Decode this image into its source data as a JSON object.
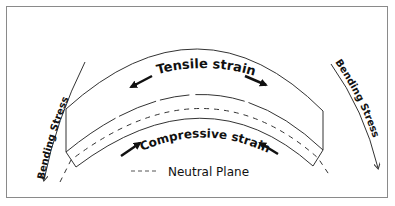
{
  "diagram": {
    "tensile_label": "Tensile strain",
    "compressive_label": "Compressive strain",
    "bending_left_label": "Bending Stress",
    "bending_right_label": "Bending Stress",
    "legend": {
      "line_style": "dashed",
      "label": "Neutral Plane"
    },
    "colors": {
      "line": "#333333",
      "text": "#111111",
      "border": "#8a8a8a",
      "background": "#ffffff"
    }
  }
}
